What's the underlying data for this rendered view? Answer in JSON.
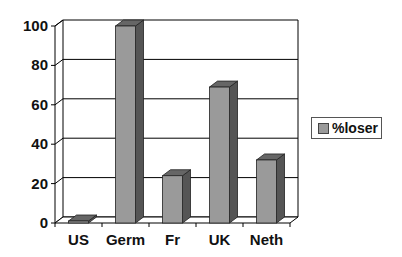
{
  "chart_data": {
    "type": "bar",
    "title": "",
    "xlabel": "",
    "ylabel": "",
    "categories": [
      "US",
      "Germ",
      "Fr",
      "UK",
      "Neth"
    ],
    "series": [
      {
        "name": "%loser",
        "values": [
          0,
          100,
          24,
          69,
          32
        ]
      }
    ],
    "ylim": [
      0,
      100
    ],
    "yticks": [
      "0",
      "20",
      "40",
      "60",
      "80",
      "100"
    ],
    "grid": true,
    "legend_position": "right",
    "style": "3d-column"
  },
  "legend": {
    "label": "%loser"
  },
  "colors": {
    "bar_front": "#9a9a9a",
    "bar_side": "#555555",
    "bar_top": "#666666",
    "grid": "#000000"
  }
}
